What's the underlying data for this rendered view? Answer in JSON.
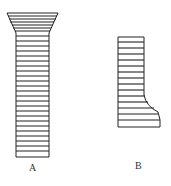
{
  "figure": {
    "items": [
      {
        "id": "A",
        "label": "A",
        "shape": "column with flared top, horizontal stripes"
      },
      {
        "id": "B",
        "label": "B",
        "shape": "column with flared bottom-right, horizontal stripes"
      }
    ],
    "colors": {
      "stroke": "#222222",
      "background": "#ffffff"
    }
  }
}
